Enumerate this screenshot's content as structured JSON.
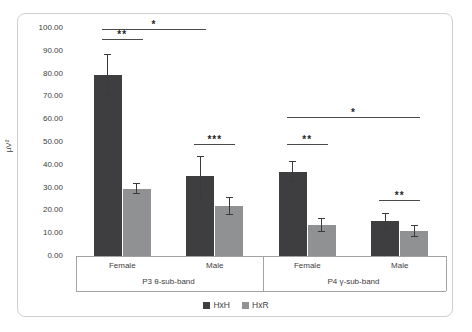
{
  "chart_data": {
    "type": "bar",
    "title": "",
    "ylabel": "µV²",
    "ylim": [
      0,
      100
    ],
    "ytick_step": 10,
    "yticks": [
      "0.00",
      "10.00",
      "20.00",
      "30.00",
      "40.00",
      "50.00",
      "60.00",
      "70.00",
      "80.00",
      "90.00",
      "100.00"
    ],
    "grid": false,
    "legend_position": "bottom",
    "groups": [
      {
        "label": "P3 θ-sub-band",
        "categories": [
          "Female",
          "Male"
        ]
      },
      {
        "label": "P4 γ-sub-band",
        "categories": [
          "Female",
          "Male"
        ]
      }
    ],
    "series": [
      {
        "name": "HxH",
        "color": "#3e3e40",
        "values": [
          79.5,
          35,
          37,
          15.5
        ],
        "errors": [
          9,
          9,
          4.5,
          3.5
        ]
      },
      {
        "name": "HxR",
        "color": "#8f9193",
        "values": [
          29.5,
          22,
          13.5,
          11
        ],
        "errors": [
          2.5,
          4,
          3,
          2.5
        ]
      }
    ],
    "significance": [
      {
        "label": "**",
        "from_bar": 0,
        "to_bar": 1,
        "y": 95
      },
      {
        "label": "*",
        "from_bar": 0,
        "to_bar": 2,
        "y": 99.5
      },
      {
        "label": "***",
        "from_bar": 2,
        "to_bar": 3,
        "y": 49
      },
      {
        "label": "**",
        "from_bar": 4,
        "to_bar": 5,
        "y": 49
      },
      {
        "label": "*",
        "from_bar": 4,
        "to_bar": 7,
        "y": 61
      },
      {
        "label": "**",
        "from_bar": 6,
        "to_bar": 7,
        "y": 24.5
      }
    ]
  }
}
